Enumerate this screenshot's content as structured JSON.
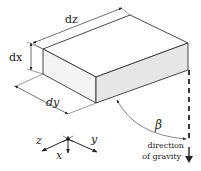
{
  "diagram": {
    "type": "isometric-box-gravity",
    "labels": {
      "dz": "dz",
      "dx": "dx",
      "dy": "dy",
      "beta": "β",
      "axis_z": "z",
      "axis_x": "x",
      "axis_y": "y",
      "gravity_line1": "direction",
      "gravity_line2": "of gravity"
    },
    "colors": {
      "line": "#333333",
      "top_face": "#ffffff",
      "left_face": "#f4f4f4",
      "front_face": "#e6e6e6",
      "background": "#ffffff"
    }
  }
}
